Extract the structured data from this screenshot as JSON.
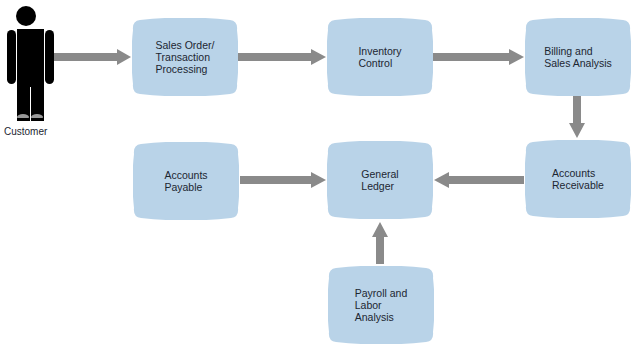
{
  "diagram": {
    "title": "",
    "actor": {
      "label": "Customer",
      "icon": "person-icon"
    },
    "nodes": [
      {
        "id": "sales_order",
        "label": "Sales Order/\nTransaction\nProcessing"
      },
      {
        "id": "inventory",
        "label": "Inventory\nControl"
      },
      {
        "id": "billing",
        "label": "Billing and\nSales Analysis"
      },
      {
        "id": "accounts_receivable",
        "label": "Accounts\nReceivable"
      },
      {
        "id": "general_ledger",
        "label": "General\nLedger"
      },
      {
        "id": "accounts_payable",
        "label": "Accounts\nPayable"
      },
      {
        "id": "payroll",
        "label": "Payroll and\nLabor\nAnalysis"
      }
    ],
    "edges": [
      {
        "from": "Customer",
        "to": "sales_order"
      },
      {
        "from": "sales_order",
        "to": "inventory"
      },
      {
        "from": "inventory",
        "to": "billing"
      },
      {
        "from": "billing",
        "to": "accounts_receivable"
      },
      {
        "from": "accounts_receivable",
        "to": "general_ledger"
      },
      {
        "from": "accounts_payable",
        "to": "general_ledger"
      },
      {
        "from": "payroll",
        "to": "general_ledger"
      }
    ],
    "colors": {
      "node_fill": "#b9d3e8",
      "arrow": "#8a8a8a",
      "text": "#1c2631",
      "actor": "#000000"
    }
  }
}
